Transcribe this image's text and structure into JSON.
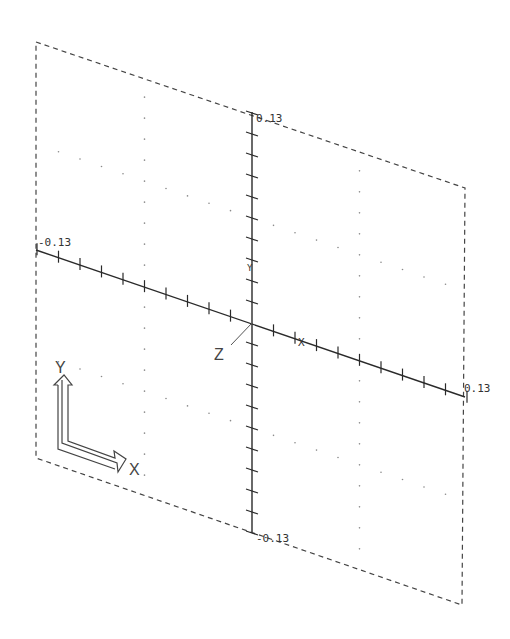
{
  "view": {
    "colors": {
      "line": "#2a2a2a",
      "frame": "#444444",
      "grid_dot": "#8a8a8a",
      "background": "#ffffff"
    }
  },
  "axes": {
    "y_top_label": "0.13",
    "y_bottom_label": "-0.13",
    "x_left_label": "-0.13",
    "x_right_label": "0.13",
    "origin_marker_x": "X",
    "origin_marker_y": "Y",
    "z_label": "Z"
  },
  "ucs_icon": {
    "x_label": "X",
    "y_label": "Y"
  }
}
